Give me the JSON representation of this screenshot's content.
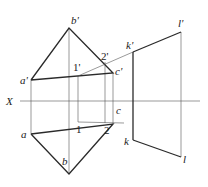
{
  "diagram": {
    "type": "orthographic-projection",
    "axis_label": "X",
    "points_front": {
      "a_prime": {
        "label": "a'",
        "x": 31,
        "y": 80
      },
      "b_prime": {
        "label": "b'",
        "x": 69,
        "y": 28
      },
      "c_prime": {
        "label": "c'",
        "x": 113,
        "y": 73
      },
      "one_prime": {
        "label": "1'",
        "x": 78,
        "y": 76
      },
      "two_prime": {
        "label": "2'",
        "x": 105,
        "y": 62
      },
      "k_prime": {
        "label": "k'",
        "x": 133,
        "y": 52
      },
      "l_prime": {
        "label": "l'",
        "x": 181,
        "y": 32
      }
    },
    "points_top": {
      "a": {
        "label": "a",
        "x": 31,
        "y": 134
      },
      "b": {
        "label": "b",
        "x": 69,
        "y": 174
      },
      "c": {
        "label": "c",
        "x": 113,
        "y": 124
      },
      "one": {
        "label": "1",
        "x": 78,
        "y": 122
      },
      "two": {
        "label": "2",
        "x": 107,
        "y": 123
      },
      "k": {
        "label": "k",
        "x": 133,
        "y": 140
      },
      "l": {
        "label": "l",
        "x": 181,
        "y": 157
      }
    }
  }
}
